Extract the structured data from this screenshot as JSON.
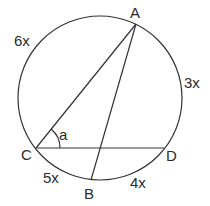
{
  "diagram": {
    "type": "inscribed-circle-geometry",
    "points": {
      "A": {
        "label": "A"
      },
      "B": {
        "label": "B"
      },
      "C": {
        "label": "C"
      },
      "D": {
        "label": "D"
      }
    },
    "arcs": [
      {
        "from": "C",
        "to": "A",
        "label": "6x"
      },
      {
        "from": "A",
        "to": "D",
        "label": "3x"
      },
      {
        "from": "D",
        "to": "B",
        "label": "4x"
      },
      {
        "from": "B",
        "to": "C",
        "label": "5x"
      }
    ],
    "segments": [
      "CA",
      "AB",
      "CD"
    ],
    "angle": {
      "vertex": "C",
      "label": "a",
      "between": [
        "CA",
        "CD"
      ]
    },
    "colors": {
      "stroke": "#333333",
      "text": "#2a2a2a",
      "background": "#ffffff"
    }
  }
}
